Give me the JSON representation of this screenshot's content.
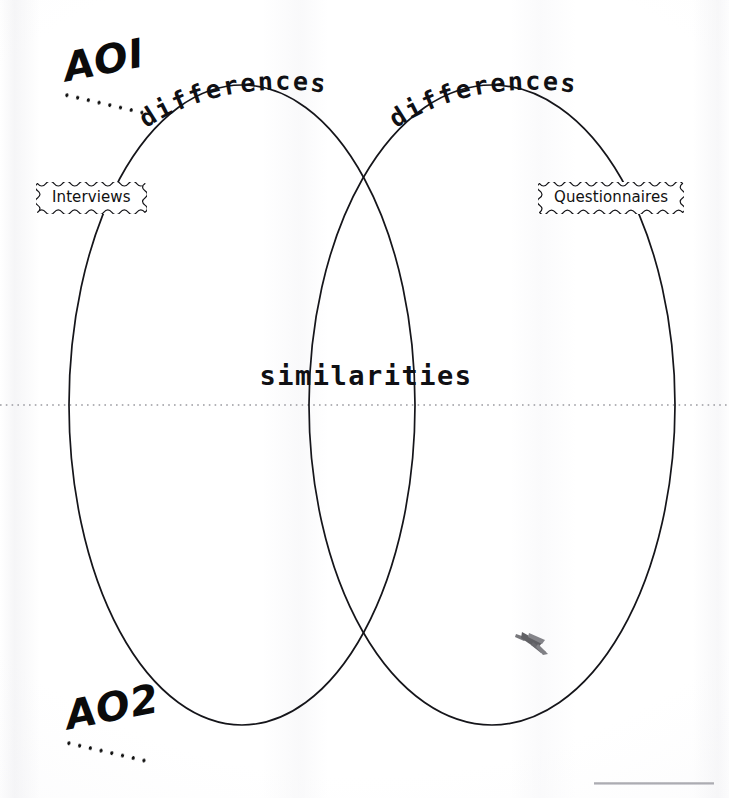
{
  "page": {
    "background_color": "#ffffff",
    "ink_color": "#111111",
    "dotted_line_color": "#9a9aa0"
  },
  "objectives": {
    "ao1": "AOI",
    "ao2": "AO2"
  },
  "circles": {
    "left": {
      "name": "Interviews",
      "heading": "differences"
    },
    "right": {
      "name": "Questionnaires",
      "heading": "differences"
    },
    "overlap": {
      "label": "similarities"
    }
  },
  "annotations": {
    "divider_style": "dotted",
    "smudge_present": "true"
  }
}
